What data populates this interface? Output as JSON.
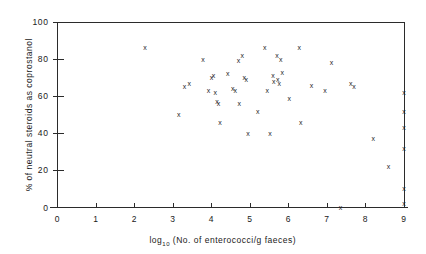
{
  "chart_data": {
    "type": "scatter",
    "title": "",
    "xlabel": "log10 (No. of enterococci/g faeces)",
    "xlabel_base": "log",
    "xlabel_subscript": "10",
    "xlabel_rest": "(No. of enterococci/g faeces)",
    "ylabel": "% of neutral steroids as coprostanol",
    "xlim": [
      0,
      9
    ],
    "ylim": [
      0,
      100
    ],
    "xticks": [
      0,
      1,
      2,
      3,
      4,
      5,
      6,
      7,
      8,
      9
    ],
    "xticklabels": [
      "0",
      "1",
      "2",
      "3",
      "4",
      "5",
      "6",
      "7",
      "8",
      "9"
    ],
    "yticks": [
      0,
      20,
      40,
      60,
      80,
      100
    ],
    "yticklabels": [
      "0",
      "20",
      "40",
      "60",
      "80",
      "100"
    ],
    "grid": false,
    "legend": false,
    "marker": "x",
    "marker_color": "#1f1f1f",
    "points": [
      {
        "x": 2.27,
        "y": 86.0
      },
      {
        "x": 3.15,
        "y": 50.0
      },
      {
        "x": 3.3,
        "y": 65.0
      },
      {
        "x": 3.42,
        "y": 67.0
      },
      {
        "x": 3.78,
        "y": 80.0
      },
      {
        "x": 3.92,
        "y": 63.0
      },
      {
        "x": 4.0,
        "y": 70.0
      },
      {
        "x": 4.05,
        "y": 71.0
      },
      {
        "x": 4.1,
        "y": 62.0
      },
      {
        "x": 4.14,
        "y": 57.0
      },
      {
        "x": 4.18,
        "y": 56.0
      },
      {
        "x": 4.22,
        "y": 46.0
      },
      {
        "x": 4.42,
        "y": 72.0
      },
      {
        "x": 4.55,
        "y": 64.0
      },
      {
        "x": 4.62,
        "y": 63.0
      },
      {
        "x": 4.7,
        "y": 79.0
      },
      {
        "x": 4.72,
        "y": 56.0
      },
      {
        "x": 4.8,
        "y": 82.0
      },
      {
        "x": 4.85,
        "y": 70.0
      },
      {
        "x": 4.9,
        "y": 69.0
      },
      {
        "x": 4.95,
        "y": 40.0
      },
      {
        "x": 5.2,
        "y": 52.0
      },
      {
        "x": 5.38,
        "y": 86.0
      },
      {
        "x": 5.45,
        "y": 63.0
      },
      {
        "x": 5.52,
        "y": 40.0
      },
      {
        "x": 5.6,
        "y": 71.0
      },
      {
        "x": 5.62,
        "y": 68.0
      },
      {
        "x": 5.7,
        "y": 82.0
      },
      {
        "x": 5.72,
        "y": 69.0
      },
      {
        "x": 5.76,
        "y": 67.0
      },
      {
        "x": 5.8,
        "y": 80.0
      },
      {
        "x": 5.84,
        "y": 73.0
      },
      {
        "x": 6.02,
        "y": 59.0
      },
      {
        "x": 6.28,
        "y": 86.0
      },
      {
        "x": 6.32,
        "y": 46.0
      },
      {
        "x": 6.6,
        "y": 66.0
      },
      {
        "x": 6.95,
        "y": 63.0
      },
      {
        "x": 7.12,
        "y": 78.0
      },
      {
        "x": 7.35,
        "y": 0.0
      },
      {
        "x": 7.62,
        "y": 67.0
      },
      {
        "x": 7.7,
        "y": 65.0
      },
      {
        "x": 8.2,
        "y": 37.0
      },
      {
        "x": 8.6,
        "y": 22.0
      },
      {
        "x": 9.0,
        "y": 62.0
      },
      {
        "x": 9.0,
        "y": 52.0
      },
      {
        "x": 9.0,
        "y": 43.0
      },
      {
        "x": 9.0,
        "y": 32.0
      },
      {
        "x": 9.0,
        "y": 10.0
      },
      {
        "x": 9.0,
        "y": 2.0
      }
    ]
  }
}
